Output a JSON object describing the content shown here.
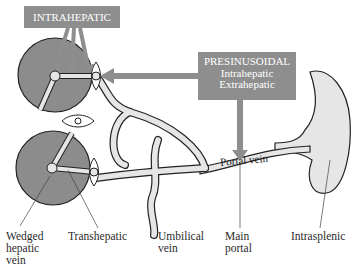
{
  "boxes": {
    "intrahepatic": {
      "title": "INTRAHEPATIC"
    },
    "presinusoidal": {
      "title": "PRESINUSOIDAL",
      "line1": "Intrahepatic",
      "line2": "Extrahepatic"
    }
  },
  "vessel_label": "Portal vein",
  "labels": {
    "wedged": [
      "Wedged",
      "hepatic",
      "vein"
    ],
    "transhepatic": "Transhepatic",
    "umbilical": [
      "Umbilical",
      "vein"
    ],
    "main_portal": [
      "Main",
      "portal"
    ],
    "intrasplenic": "Intrasplenic"
  },
  "colors": {
    "box": "#8e8e8e",
    "lobule": "#8c8c8c",
    "vessel_fill": "#e6e6e6",
    "outline": "#222222"
  }
}
